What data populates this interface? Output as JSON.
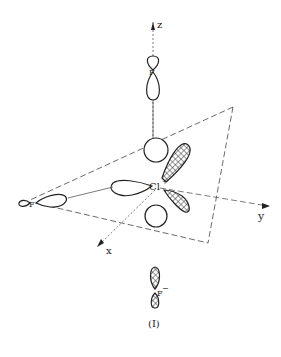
{
  "diagram": {
    "type": "molecular-orbital",
    "caption": "(I)",
    "axes": {
      "z": "z",
      "y": "y",
      "x": "x"
    },
    "atoms": {
      "center": "Cl",
      "top": "F",
      "left": "F",
      "bottom": "F"
    },
    "charges": {
      "center": "+",
      "bottom": "−"
    },
    "colors": {
      "line": "#222222",
      "background": "#ffffff"
    }
  }
}
